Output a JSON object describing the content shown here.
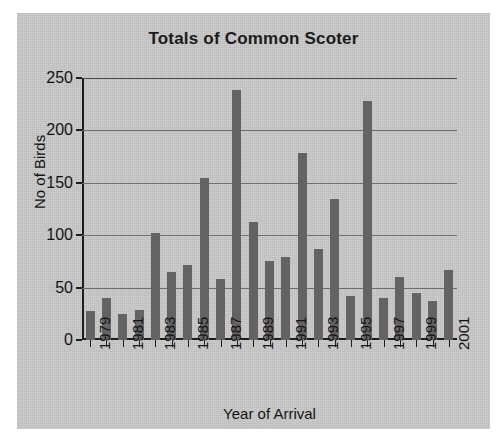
{
  "chart_data": {
    "type": "bar",
    "title": "Totals of Common Scoter",
    "xlabel": "Year of Arrival",
    "ylabel": "No of Birds",
    "categories": [
      "1979",
      "1980",
      "1981",
      "1982",
      "1983",
      "1984",
      "1985",
      "1986",
      "1987",
      "1988",
      "1989",
      "1990",
      "1991",
      "1992",
      "1993",
      "1994",
      "1995",
      "1996",
      "1997",
      "1998",
      "1999",
      "2000",
      "2001"
    ],
    "values": [
      28,
      40,
      25,
      29,
      102,
      65,
      72,
      155,
      58,
      239,
      113,
      75,
      79,
      178,
      87,
      135,
      42,
      228,
      40,
      60,
      45,
      37,
      67
    ],
    "tick_labels": [
      "1979",
      "",
      "1981",
      "",
      "1983",
      "",
      "1985",
      "",
      "1987",
      "",
      "1989",
      "",
      "1991",
      "",
      "1993",
      "",
      "1995",
      "",
      "1997",
      "",
      "1999",
      "",
      "2001"
    ],
    "ylim": [
      0,
      250
    ],
    "yticks": [
      0,
      50,
      100,
      150,
      200,
      250
    ],
    "ytick_labels": [
      "0",
      "50",
      "100",
      "150",
      "200",
      "250"
    ],
    "grid": true,
    "legend": false,
    "series_color": "#636363",
    "plot_background": "#c9c9c9",
    "axis_color": "#1d1d1d"
  }
}
